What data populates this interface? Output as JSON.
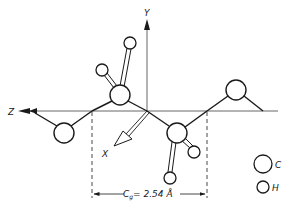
{
  "diagram": {
    "type": "molecular structure (zig-zag chain) with coordinate axes",
    "axes": {
      "y_label": "Y",
      "z_label": "Z",
      "x_label": "X"
    },
    "dimension": {
      "symbol": "C",
      "subscript": "g",
      "value_text": "= 2.54 Å"
    },
    "legend": [
      {
        "symbol": "carbon-atom",
        "label": "C"
      },
      {
        "symbol": "hydrogen-atom",
        "label": "H"
      }
    ],
    "atoms": [
      {
        "element": "C",
        "position": "left chain atom below axis"
      },
      {
        "element": "C",
        "position": "center-left chain atom above axis"
      },
      {
        "element": "C",
        "position": "center-right chain atom below axis"
      },
      {
        "element": "C",
        "position": "right chain atom above axis"
      },
      {
        "element": "H",
        "position": "on center-left carbon (left)"
      },
      {
        "element": "H",
        "position": "on center-left carbon (up)"
      },
      {
        "element": "H",
        "position": "on center-right carbon (right)"
      },
      {
        "element": "H",
        "position": "on center-right carbon (down)"
      }
    ],
    "colors": {
      "stroke": "#1a1a1a",
      "axis": "#555555",
      "background": "#ffffff"
    }
  }
}
